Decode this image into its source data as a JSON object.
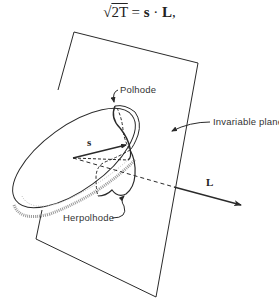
{
  "equation": {
    "radical": "√",
    "radicand": "2T",
    "equals": " = ",
    "rhs_s": "s",
    "dot": " · ",
    "rhs_L": "L",
    "trailing": ","
  },
  "labels": {
    "polhode": "Polhode",
    "herpolhode": "Herpolhode",
    "invariable_plane": "Invariable plane",
    "vector_s": "s",
    "vector_L": "L"
  },
  "colors": {
    "line": "#2a2a2a",
    "shading": "#9a9a9a",
    "background": "#ffffff"
  }
}
